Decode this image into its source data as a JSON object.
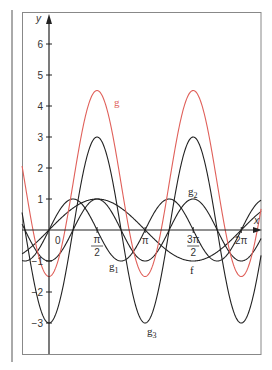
{
  "chart_data": {
    "type": "line",
    "title": "",
    "xlabel": "x",
    "ylabel": "y",
    "xlim": [
      -0.88,
      6.93
    ],
    "ylim": [
      -4.0,
      7.0
    ],
    "grid": false,
    "x_ticks": [
      {
        "value": 0,
        "label": "0"
      },
      {
        "value": 1.5708,
        "label_num": "π",
        "label_den": "2"
      },
      {
        "value": 3.1416,
        "label": "π"
      },
      {
        "value": 4.7124,
        "label_num": "3π",
        "label_den": "2"
      },
      {
        "value": 6.2832,
        "label": "2π"
      }
    ],
    "y_ticks": [
      {
        "value": 6,
        "label": "6"
      },
      {
        "value": 5,
        "label": "5"
      },
      {
        "value": 4,
        "label": "4"
      },
      {
        "value": 3,
        "label": "3"
      },
      {
        "value": 2,
        "label": "2"
      },
      {
        "value": 1,
        "label": "1"
      },
      {
        "value": -1,
        "label": "−1"
      },
      {
        "value": -2,
        "label": "−2"
      },
      {
        "value": -3,
        "label": "−3"
      }
    ],
    "series": [
      {
        "name": "f",
        "formula": "sin(x)",
        "color": "#222222",
        "amplitude": 1,
        "offset": 0,
        "freq": 1,
        "kind": "sin",
        "label_pos": [
          4.71,
          -1.3
        ]
      },
      {
        "name": "g1",
        "formula": "sin(2x)",
        "color": "#222222",
        "amplitude": 1,
        "offset": 0,
        "freq": 2,
        "kind": "sin",
        "label_pos": [
          2.08,
          -1.25
        ]
      },
      {
        "name": "g2",
        "formula": "-cos(2x)",
        "color": "#222222",
        "amplitude": -1,
        "offset": 0,
        "freq": 2,
        "kind": "cos",
        "label_pos": [
          4.71,
          1.22
        ]
      },
      {
        "name": "g3",
        "formula": "-3cos(2x)",
        "color": "#222222",
        "amplitude": -3,
        "offset": 0,
        "freq": 2,
        "kind": "cos",
        "label_pos": [
          3.27,
          -3.45
        ]
      },
      {
        "name": "g",
        "formula": "1.5 - 3cos(2x)",
        "color": "#e0605a",
        "amplitude": -3,
        "offset": 1.5,
        "freq": 2,
        "kind": "cos",
        "label_pos": [
          2.19,
          4.1
        ]
      }
    ],
    "legend": null
  },
  "labels": {
    "f": "f",
    "g1_main": "g",
    "g1_sub": "1",
    "g2_main": "g",
    "g2_sub": "2",
    "g3_main": "g",
    "g3_sub": "3",
    "g": "g",
    "x_axis": "x",
    "y_axis": "y"
  }
}
